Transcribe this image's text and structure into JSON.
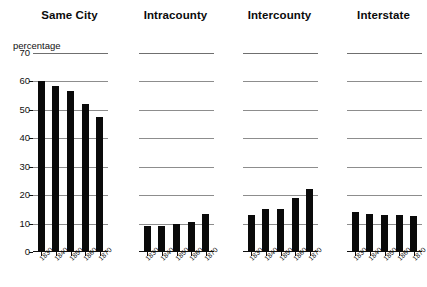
{
  "chart_data": {
    "type": "bar",
    "title": "",
    "xlabel": "",
    "ylabel": "percentage",
    "ylim": [
      0,
      70
    ],
    "yticks": [
      0,
      10,
      20,
      30,
      40,
      50,
      60,
      70
    ],
    "ytick_labels": [
      "0",
      "10",
      "20",
      "30",
      "40",
      "50",
      "60",
      "70"
    ],
    "grid": true,
    "legend": "none",
    "categories": [
      "1830",
      "1840",
      "1850",
      "1860",
      "1870"
    ],
    "panels": [
      {
        "title": "Same City",
        "values": [
          60.0,
          58.5,
          56.5,
          52.0,
          47.5
        ]
      },
      {
        "title": "Intracounty",
        "values": [
          9.0,
          9.0,
          10.0,
          10.5,
          13.5
        ]
      },
      {
        "title": "Intercounty",
        "values": [
          13.0,
          15.0,
          15.0,
          19.0,
          22.0
        ]
      },
      {
        "title": "Interstate",
        "values": [
          14.0,
          13.5,
          13.0,
          13.0,
          12.5
        ]
      }
    ],
    "series": [
      {
        "name": "Same City",
        "values": [
          60.0,
          58.5,
          56.5,
          52.0,
          47.5
        ]
      },
      {
        "name": "Intracounty",
        "values": [
          9.0,
          9.0,
          10.0,
          10.5,
          13.5
        ]
      },
      {
        "name": "Intercounty",
        "values": [
          13.0,
          15.0,
          15.0,
          19.0,
          22.0
        ]
      },
      {
        "name": "Interstate",
        "values": [
          14.0,
          13.5,
          13.0,
          13.0,
          12.5
        ]
      }
    ],
    "colors": {
      "bar": "#0a0a0a",
      "gridline": "#8d8d8d",
      "axis": "#111111",
      "background": "#ffffff"
    }
  }
}
